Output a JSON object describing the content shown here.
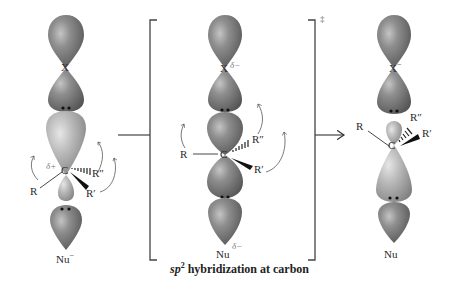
{
  "colors": {
    "dark_lobe": "#8a8a8a",
    "dark_lobe_edge": "#5a5a5a",
    "light_lobe": "#b8b8b8",
    "bracket": "#444444",
    "text": "#2a2a2a"
  },
  "reactant": {
    "leaving_group": "X",
    "central_atom": "C",
    "central_charge": "δ+",
    "substituents": [
      "R",
      "R′",
      "R″"
    ],
    "nucleophile": "Nu",
    "nucleophile_charge": "−"
  },
  "transition_state": {
    "leaving_group": "X",
    "leaving_group_charge": "δ−",
    "central_atom": "C",
    "substituents": [
      "R",
      "R′",
      "R″"
    ],
    "nucleophile": "Nu",
    "nucleophile_charge": "δ−",
    "symbol": "‡",
    "caption_prefix": "sp",
    "caption_superscript": "2",
    "caption_rest": " hybridization at carbon"
  },
  "product": {
    "leaving_group": "X",
    "leaving_group_charge": "−",
    "central_atom": "C",
    "substituents": [
      "R",
      "R′",
      "R″"
    ],
    "nucleophile": "Nu"
  }
}
